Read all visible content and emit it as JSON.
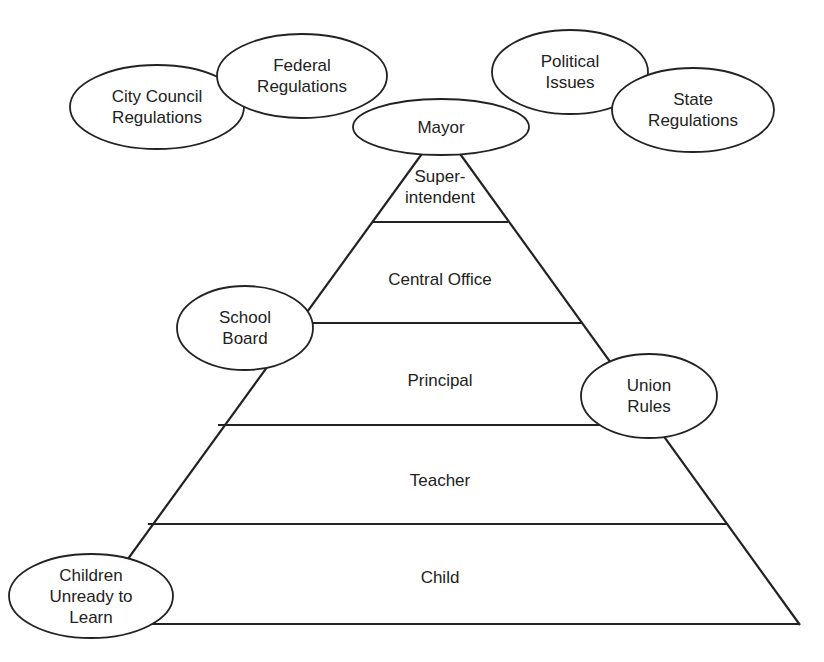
{
  "diagram": {
    "type": "pyramid-hierarchy",
    "pyramid_levels": [
      {
        "label": "Super-\nintendent"
      },
      {
        "label": "Central Office"
      },
      {
        "label": "Principal"
      },
      {
        "label": "Teacher"
      },
      {
        "label": "Child"
      }
    ],
    "influences": [
      {
        "label": "City Council\nRegulations"
      },
      {
        "label": "Federal\nRegulations"
      },
      {
        "label": "Mayor"
      },
      {
        "label": "Political\nIssues"
      },
      {
        "label": "State\nRegulations"
      },
      {
        "label": "School\nBoard"
      },
      {
        "label": "Union\nRules"
      },
      {
        "label": "Children\nUnready to\nLearn"
      }
    ],
    "colors": {
      "stroke": "#222222",
      "background": "#ffffff",
      "fill": "#ffffff"
    }
  }
}
